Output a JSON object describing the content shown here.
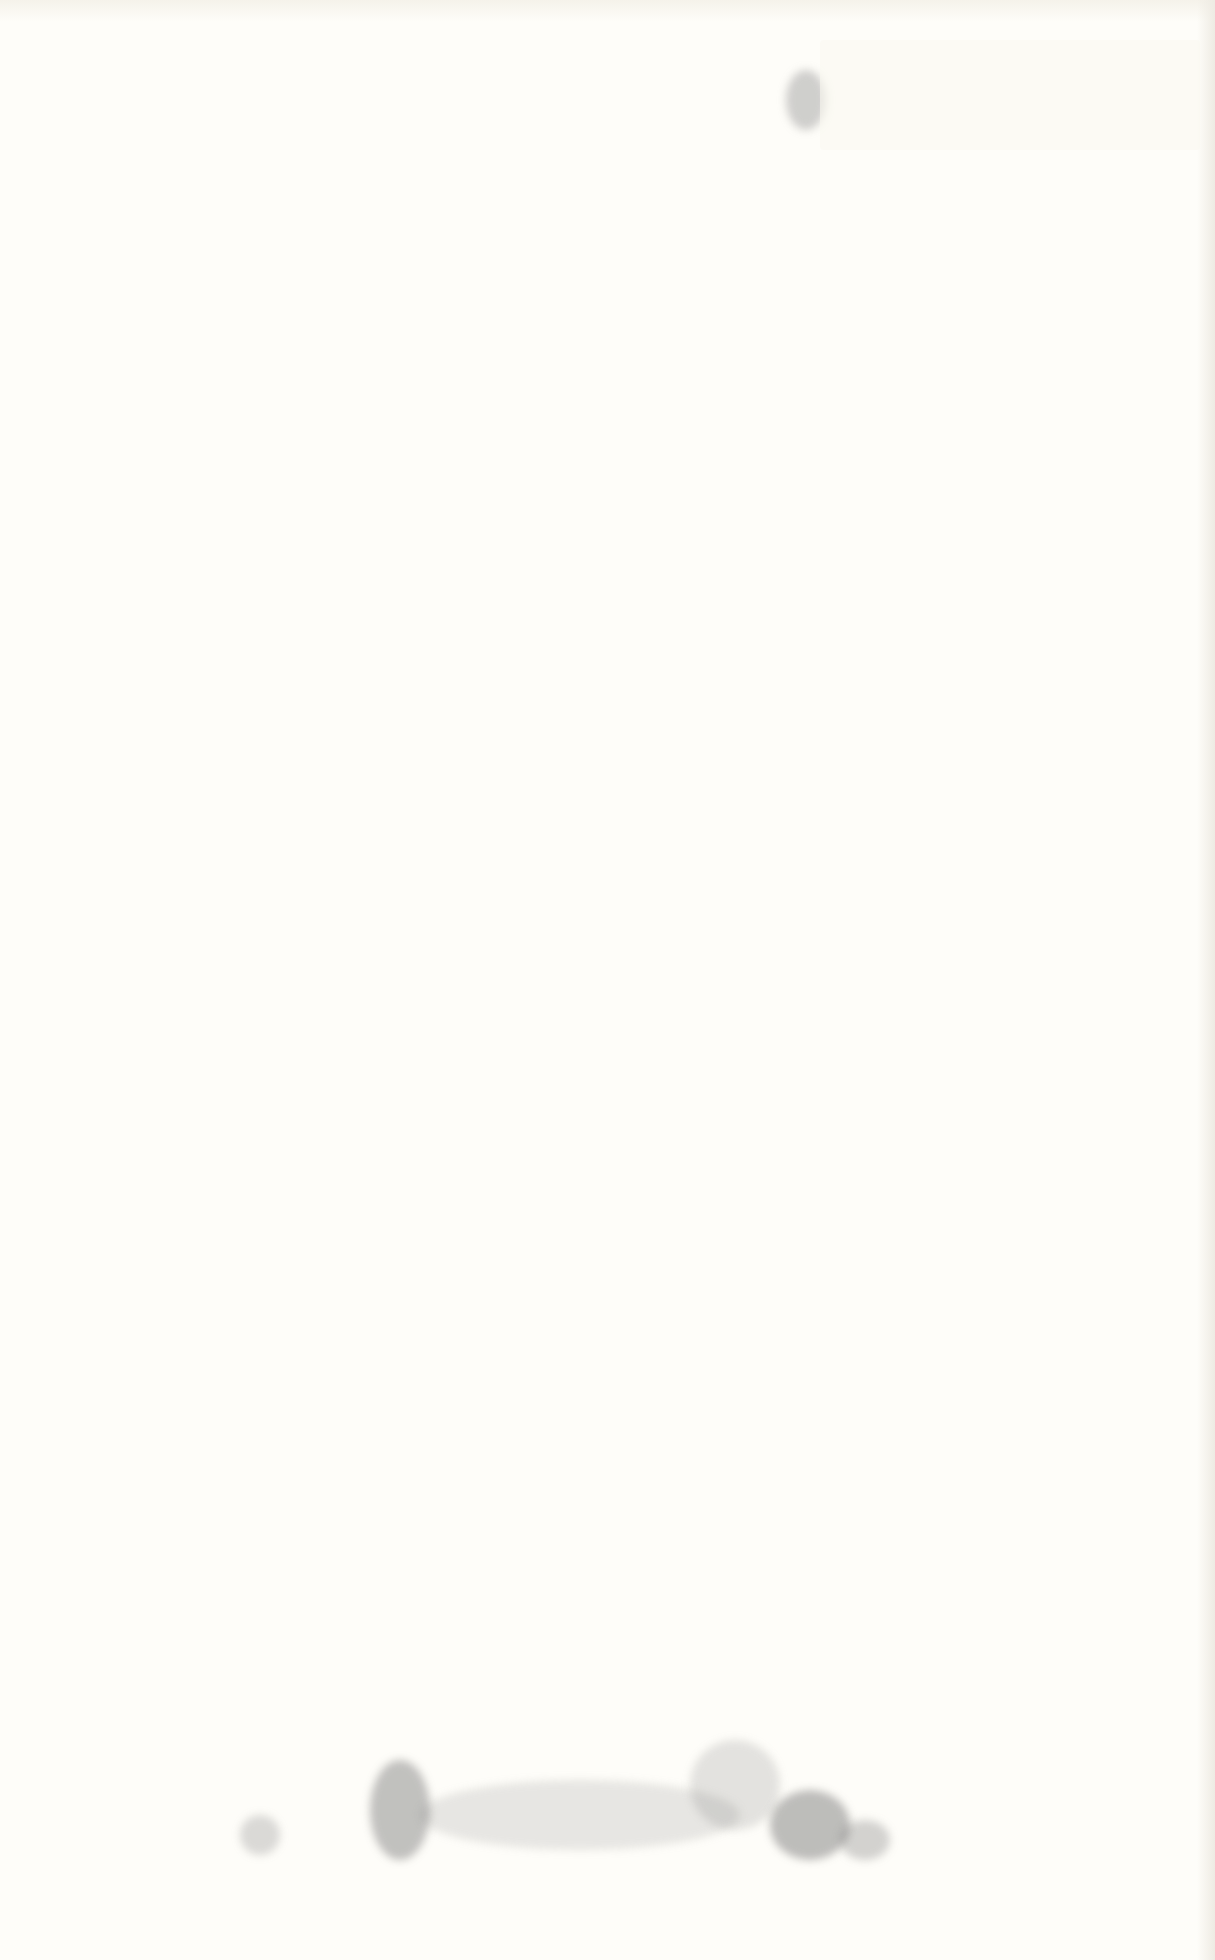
{
  "page": {
    "type": "scanned-blank-page",
    "background_color": "#fefdf9",
    "visible_text": ""
  }
}
